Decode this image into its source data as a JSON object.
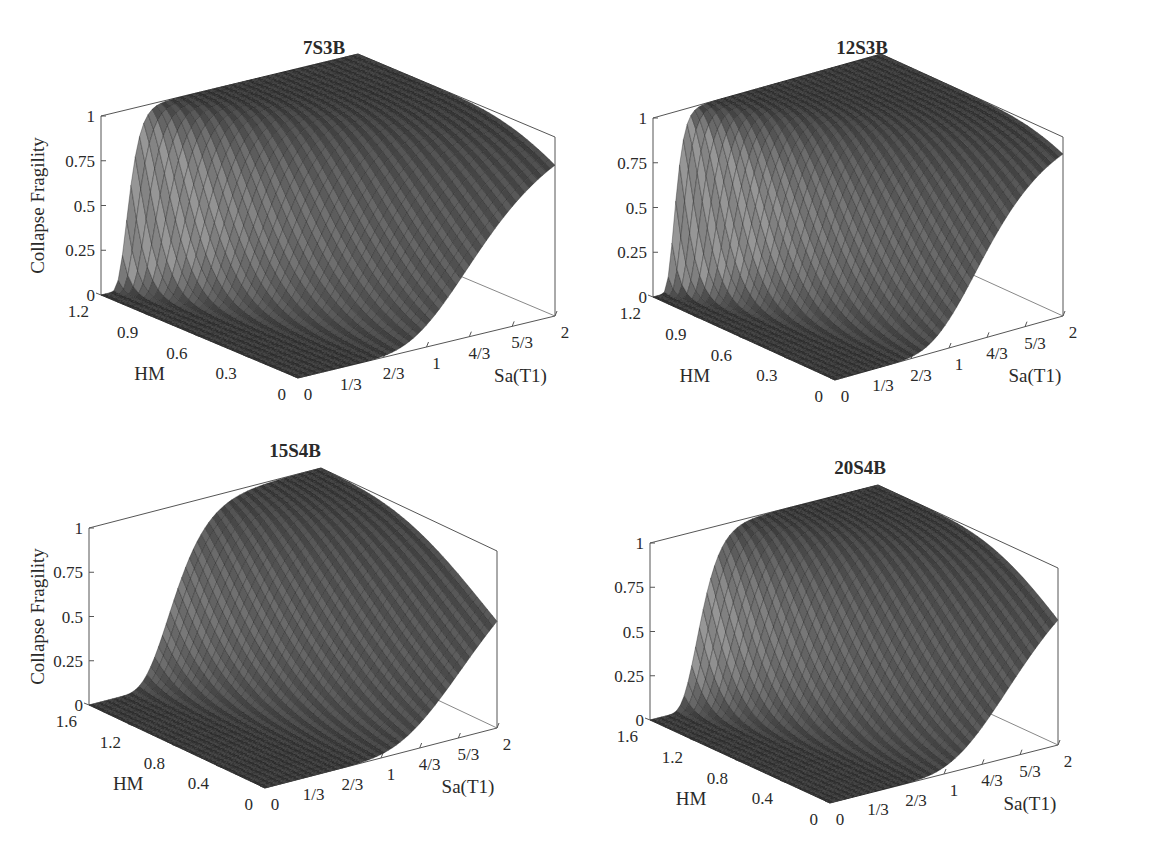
{
  "figure": {
    "surface_color_light": "#8a8a8a",
    "surface_color_dark": "#1c1c1c",
    "axis_color": "#555555"
  },
  "chart_data": [
    {
      "type": "surface3d",
      "title": "7S3B",
      "xlabel": "Sa(T1)",
      "ylabel": "HM",
      "zlabel": "Collapse Fragility",
      "x_ticks": [
        "0",
        "1/3",
        "2/3",
        "1",
        "4/3",
        "5/3",
        "2"
      ],
      "y_ticks": [
        "0",
        "0.3",
        "0.6",
        "0.9",
        "1.2"
      ],
      "z_ticks": [
        "0",
        "0.25",
        "0.5",
        "0.75",
        "1"
      ],
      "xlim": [
        0,
        2
      ],
      "ylim": [
        0,
        1.2
      ],
      "zlim": [
        0,
        1
      ],
      "surface": {
        "median_at_hm0": 1.45,
        "median_at_hmmax": 0.22,
        "dispersion": 0.32
      },
      "grid": false
    },
    {
      "type": "surface3d",
      "title": "12S3B",
      "xlabel": "Sa(T1)",
      "ylabel": "HM",
      "zlabel": "",
      "x_ticks": [
        "0",
        "1/3",
        "2/3",
        "1",
        "4/3",
        "5/3",
        "2"
      ],
      "y_ticks": [
        "0",
        "0.3",
        "0.6",
        "0.9",
        "1.2"
      ],
      "z_ticks": [
        "0",
        "0.25",
        "0.5",
        "0.75",
        "1"
      ],
      "xlim": [
        0,
        2
      ],
      "ylim": [
        0,
        1.2
      ],
      "zlim": [
        0,
        1
      ],
      "surface": {
        "median_at_hm0": 1.35,
        "median_at_hmmax": 0.2,
        "dispersion": 0.3
      },
      "grid": false
    },
    {
      "type": "surface3d",
      "title": "15S4B",
      "xlabel": "Sa(T1)",
      "ylabel": "HM",
      "zlabel": "Collapse Fragility",
      "x_ticks": [
        "0",
        "1/3",
        "2/3",
        "1",
        "4/3",
        "5/3",
        "2"
      ],
      "y_ticks": [
        "0",
        "0.4",
        "0.8",
        "1.2",
        "1.6"
      ],
      "z_ticks": [
        "0",
        "0.25",
        "0.5",
        "0.75",
        "1"
      ],
      "xlim": [
        0,
        2
      ],
      "ylim": [
        0,
        1.6
      ],
      "zlim": [
        0,
        1
      ],
      "surface": {
        "median_at_hm0": 1.85,
        "median_at_hmmax": 0.75,
        "dispersion": 0.3
      },
      "grid": false
    },
    {
      "type": "surface3d",
      "title": "20S4B",
      "xlabel": "Sa(T1)",
      "ylabel": "HM",
      "zlabel": "",
      "x_ticks": [
        "0",
        "1/3",
        "2/3",
        "1",
        "4/3",
        "5/3",
        "2"
      ],
      "y_ticks": [
        "0",
        "0.4",
        "0.8",
        "1.2",
        "1.6"
      ],
      "z_ticks": [
        "0",
        "0.25",
        "0.5",
        "0.75",
        "1"
      ],
      "xlim": [
        0,
        2
      ],
      "ylim": [
        0,
        1.6
      ],
      "zlim": [
        0,
        1
      ],
      "surface": {
        "median_at_hm0": 1.7,
        "median_at_hmmax": 0.45,
        "dispersion": 0.3
      },
      "grid": false
    }
  ],
  "layout": [
    {
      "zx": 101,
      "z0y": 295,
      "z1y": 116,
      "o": [
        298,
        378
      ],
      "sa2": [
        555,
        316
      ],
      "hmmax": [
        101,
        295
      ],
      "title_pos": [
        324,
        54
      ],
      "zlabel_x": 44
    },
    {
      "zx": 653,
      "z0y": 297,
      "z1y": 118,
      "o": [
        835,
        380
      ],
      "sa2": [
        1063,
        316
      ],
      "hmmax": [
        653,
        297
      ],
      "title_pos": [
        862,
        54
      ],
      "zlabel_x": null
    },
    {
      "zx": 89,
      "z0y": 705,
      "z1y": 528,
      "o": [
        265,
        788
      ],
      "sa2": [
        497,
        728
      ],
      "hmmax": [
        89,
        705
      ],
      "title_pos": [
        295,
        457
      ],
      "zlabel_x": 44
    },
    {
      "zx": 650,
      "z0y": 720,
      "z1y": 543,
      "o": [
        830,
        803
      ],
      "sa2": [
        1058,
        745
      ],
      "hmmax": [
        650,
        720
      ],
      "title_pos": [
        860,
        474
      ],
      "zlabel_x": null
    }
  ]
}
